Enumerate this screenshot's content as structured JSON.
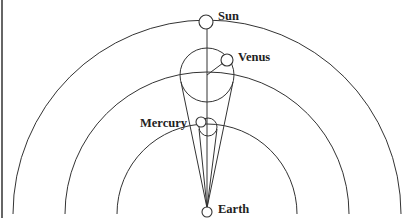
{
  "diagram": {
    "type": "geocentric-ptolemaic-inner-planets",
    "labels": {
      "sun": "Sun",
      "venus": "Venus",
      "mercury": "Mercury",
      "earth": "Earth"
    },
    "colors": {
      "line": "#333333",
      "text": "#222222",
      "background": "#ffffff"
    },
    "orbits": [
      {
        "name": "sun-deferent",
        "radius": 193
      },
      {
        "name": "venus-deferent",
        "radius": 142
      },
      {
        "name": "mercury-deferent",
        "radius": 90
      }
    ],
    "epicycles": [
      {
        "name": "venus-epicycle",
        "center": [
          207,
          75
        ],
        "radius": 27
      },
      {
        "name": "mercury-epicycle",
        "center": [
          207,
          126
        ],
        "radius": 9
      }
    ]
  }
}
